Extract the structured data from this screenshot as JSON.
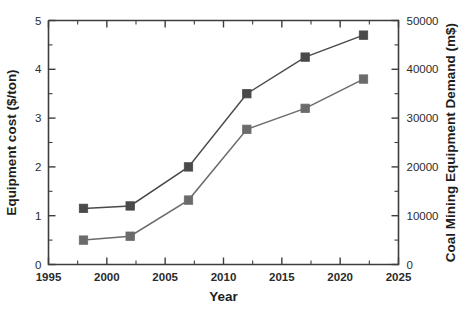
{
  "chart_data": {
    "type": "line",
    "title": "",
    "xlabel": "Year",
    "ylabel": "Equipment cost ($/ton)",
    "y2label": "Coal Mining Equipment Demand (m$)",
    "xlim": [
      1995,
      2025
    ],
    "ylim": [
      0,
      5
    ],
    "y2lim": [
      0,
      50000
    ],
    "xticks": [
      1995,
      2000,
      2005,
      2010,
      2015,
      2020,
      2025
    ],
    "xticklabels": [
      "1995",
      "2000",
      "2005",
      "2010",
      "2015",
      "2020",
      "2025"
    ],
    "yticks": [
      0,
      1,
      2,
      3,
      4,
      5
    ],
    "yticklabels": [
      "0",
      "1",
      "2",
      "3",
      "4",
      "5"
    ],
    "y2ticks": [
      0,
      10000,
      20000,
      30000,
      40000,
      50000
    ],
    "y2ticklabels": [
      "0",
      "10000",
      "20000",
      "30000",
      "40000",
      "50000"
    ],
    "minor_ticks": true,
    "grid": false,
    "legend": "none",
    "x": [
      1998,
      2002,
      2007,
      2012,
      2017,
      2022
    ],
    "series": [
      {
        "name": "Equipment cost ($/ton)",
        "axis": "left",
        "color": "#4a4a4a",
        "marker": "square",
        "values": [
          1.15,
          1.2,
          2.0,
          3.5,
          4.25,
          4.7
        ]
      },
      {
        "name": "Coal Mining Equipment Demand (m$)",
        "axis": "left",
        "color": "#6b6b6b",
        "marker": "square",
        "values": [
          0.5,
          0.58,
          1.32,
          2.77,
          3.2,
          3.8
        ]
      }
    ]
  },
  "colors": {
    "axis": "#3d3d3d",
    "text": "#1e1e1e",
    "series_upper": "#4a4a4a",
    "series_lower": "#6b6b6b",
    "background": "#ffffff"
  }
}
